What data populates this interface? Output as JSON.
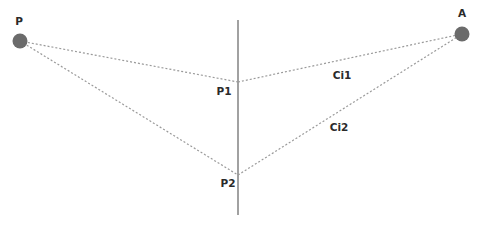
{
  "diagram": {
    "type": "refraction-paths",
    "colors": {
      "background": "#ffffff",
      "point_fill": "#6b6b6b",
      "boundary_line": "#8a8a8a",
      "path_line": "#9a9a9a",
      "label": "#2a2a2a"
    },
    "boundary": {
      "x": 238,
      "y1": 20,
      "y2": 215
    },
    "points": {
      "P": {
        "label": "P",
        "x": 20,
        "y": 41,
        "r": 7.5,
        "label_x": 19,
        "label_y": 25
      },
      "A": {
        "label": "A",
        "x": 462,
        "y": 34,
        "r": 7.5,
        "label_x": 462,
        "label_y": 17
      },
      "P1": {
        "label": "P1",
        "x": 238,
        "y": 82,
        "label_x": 224,
        "label_y": 95
      },
      "P2": {
        "label": "P2",
        "x": 238,
        "y": 175,
        "label_x": 228,
        "label_y": 187
      }
    },
    "paths": [
      {
        "name": "Ci1",
        "label": "Ci1",
        "label_x": 342,
        "label_y": 79
      },
      {
        "name": "Ci2",
        "label": "Ci2",
        "label_x": 339,
        "label_y": 131
      }
    ]
  }
}
